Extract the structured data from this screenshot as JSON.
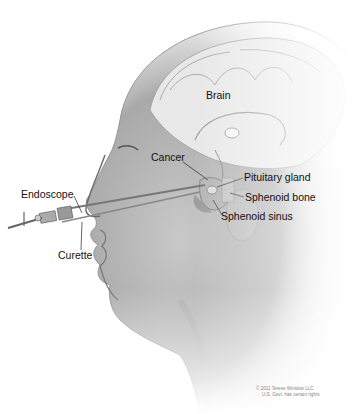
{
  "diagram": {
    "labels": {
      "brain": "Brain",
      "cancer": "Cancer",
      "pituitary_gland": "Pituitary gland",
      "sphenoid_bone": "Sphenoid bone",
      "sphenoid_sinus": "Sphenoid sinus",
      "endoscope": "Endoscope",
      "curette": "Curette"
    },
    "copyright": {
      "line1": "© 2011 Terese Winslow LLC",
      "line2": "U.S. Govt. has certain rights"
    },
    "colors": {
      "skin_shade": "#9a9a9a",
      "skin_light": "#d8d8d8",
      "brain": "#e6e6e6",
      "label_text": "#111111",
      "background": "#ffffff"
    }
  }
}
